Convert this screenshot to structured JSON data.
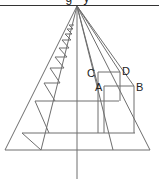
{
  "header": {
    "text": "g                y"
  },
  "diagram": {
    "labels": {
      "A": "A",
      "B": "B",
      "C": "C",
      "D": "D"
    },
    "vanishing_point": {
      "x": 77,
      "y": 6
    },
    "stroke_color": "#6e6e6e",
    "horizon_color": "#333333"
  }
}
